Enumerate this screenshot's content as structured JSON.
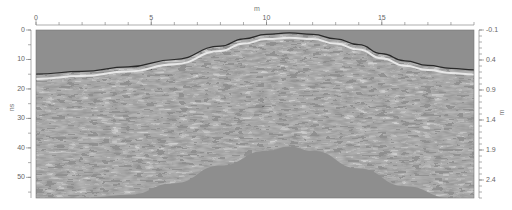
{
  "chart_data": {
    "type": "heatmap",
    "title": "",
    "x_axis": {
      "position": "top",
      "label": "m",
      "range": [
        0,
        19
      ],
      "ticks": [
        0,
        5,
        10,
        15
      ],
      "minor_tick_step": 1
    },
    "y_axis_left": {
      "label": "ns",
      "range": [
        0,
        57
      ],
      "ticks": [
        0,
        10,
        20,
        30,
        40,
        50
      ],
      "minor_tick_step": 5
    },
    "y_axis_right": {
      "label": "m",
      "range": [
        -0.1,
        2.7
      ],
      "ticks": [
        -0.1,
        0.4,
        0.9,
        1.4,
        1.9,
        2.4
      ],
      "minor_tick_step": 0.1
    },
    "surface_profile_ns": {
      "x": [
        0,
        2,
        4,
        6,
        8,
        9,
        10,
        11,
        12,
        13,
        14,
        15,
        16,
        17,
        18,
        19
      ],
      "y": [
        15,
        14,
        12.5,
        10,
        5.5,
        3,
        1.5,
        1,
        1.5,
        3,
        5,
        8,
        10.5,
        12,
        13,
        13.5
      ]
    },
    "lower_boundary_ns": {
      "x": [
        0,
        2,
        4,
        6,
        8,
        10,
        11,
        12,
        14,
        16,
        18,
        19
      ],
      "y": [
        57,
        57,
        56,
        52,
        46,
        41,
        39.5,
        41,
        47,
        53,
        57,
        57
      ]
    },
    "colors": {
      "background_gray": "#8c8c8c",
      "frame": "#555555"
    }
  },
  "labels": {
    "top_title": "m",
    "left_title": "ns",
    "right_title": "m",
    "top_ticks": [
      "0",
      "5",
      "10",
      "15"
    ],
    "left_ticks": [
      "0",
      "10",
      "20",
      "30",
      "40",
      "50"
    ],
    "right_ticks": [
      "-0.1",
      "0.4",
      "0.9",
      "1.4",
      "1.9",
      "2.4"
    ]
  }
}
